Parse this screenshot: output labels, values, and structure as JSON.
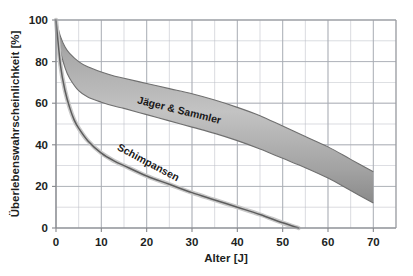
{
  "chart_data": {
    "type": "line",
    "title": "",
    "xlabel": "Alter [J]",
    "ylabel": "Überlebenswahrscheinlichkeit [%]",
    "xlim": [
      0,
      75
    ],
    "ylim": [
      0,
      100
    ],
    "x_ticks": [
      0,
      10,
      20,
      30,
      40,
      50,
      60,
      70
    ],
    "x_tick_labels": [
      "0",
      "10",
      "20",
      "30",
      "40",
      "50",
      "60",
      "70"
    ],
    "x_minor_step": 5,
    "y_ticks": [
      0,
      20,
      40,
      60,
      80,
      100
    ],
    "y_tick_labels": [
      "0",
      "20",
      "40",
      "60",
      "80",
      "100"
    ],
    "y_minor_step": 10,
    "grid": true,
    "legend_position": "inline-annotations",
    "series": [
      {
        "name": "Jäger & Sammler",
        "kind": "band",
        "label_x": 27,
        "label_y": 55,
        "label_rotation": 14,
        "x": [
          0,
          1,
          2,
          3,
          5,
          7,
          10,
          13,
          15,
          20,
          25,
          30,
          35,
          40,
          45,
          50,
          55,
          60,
          65,
          70
        ],
        "upper": [
          100,
          92,
          87,
          84,
          80,
          77.5,
          75,
          73,
          72,
          69.5,
          67,
          64.5,
          61.5,
          58,
          54,
          49,
          44,
          39,
          33,
          27
        ],
        "lower": [
          100,
          85,
          77,
          72,
          66,
          63,
          60.5,
          58.5,
          57.5,
          54.5,
          51.5,
          48.5,
          45.5,
          42,
          38,
          33.5,
          29,
          24,
          18,
          12
        ]
      },
      {
        "name": "Schimpansen",
        "kind": "line",
        "label_x": 20,
        "label_y": 30,
        "label_rotation": 28,
        "x": [
          0,
          1,
          2,
          3,
          4,
          5,
          7,
          10,
          13,
          15,
          20,
          25,
          30,
          35,
          40,
          45,
          50,
          53.5
        ],
        "y": [
          100,
          78,
          66,
          58,
          52,
          48,
          42,
          36,
          32,
          30,
          25,
          21,
          17,
          13.5,
          10,
          6.5,
          2.5,
          0
        ]
      }
    ]
  },
  "axis_ticks_x": [
    "0",
    "10",
    "20",
    "30",
    "40",
    "50",
    "60",
    "70"
  ],
  "axis_ticks_y": [
    "0",
    "20",
    "40",
    "60",
    "80",
    "100"
  ],
  "labels": {
    "x_axis_title": "Alter [J]",
    "y_axis_title": "Überlebenswahrscheinlichkeit [%]",
    "series_hunter": "Jäger & Sammler",
    "series_chimp": "Schimpansen"
  },
  "colors": {
    "band_fill": "#9a9a9a",
    "band_edge": "#6d6d6d",
    "line": "#5a5a5a",
    "grid": "#b9bcc4",
    "axis": "#86888c",
    "text": "#211f1e",
    "background": "#ffffff"
  }
}
